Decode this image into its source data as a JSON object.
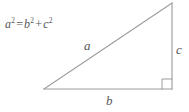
{
  "figure": {
    "name": "pythagorean-theorem-right-triangle",
    "background_color": "#ffffff",
    "width": 189,
    "height": 112,
    "stroke_color": "#9b9b9d",
    "text_color": "#58585a"
  },
  "equation": {
    "full_text": "a² = b² + c²",
    "base_a": "a",
    "exp_a": "2",
    "equals": "=",
    "base_b": "b",
    "exp_b": "2",
    "plus": "+",
    "base_c": "c",
    "exp_c": "2"
  },
  "labels": {
    "hypotenuse": "a",
    "base": "b",
    "vertical_leg": "c"
  },
  "geometry": {
    "apex": {
      "x": 172,
      "y": 3
    },
    "bottom_left": {
      "x": 44,
      "y": 89
    },
    "bottom_right": {
      "x": 172,
      "y": 89
    },
    "right_angle_marker_size": 10
  }
}
